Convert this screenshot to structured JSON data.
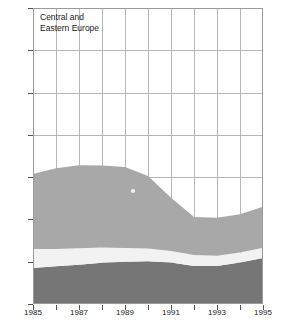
{
  "chart_data": {
    "type": "area",
    "title": "Central and\nEastern Europe",
    "xlabel": "",
    "ylabel": "",
    "ylim": [
      0,
      1400
    ],
    "xlim": [
      1985,
      1995
    ],
    "grid": true,
    "legend": "none",
    "stacked": true,
    "x": [
      1985,
      1986,
      1987,
      1988,
      1989,
      1990,
      1991,
      1992,
      1993,
      1994,
      1995
    ],
    "y_ticks": [
      0,
      200,
      400,
      600,
      800,
      1000,
      1200,
      1400
    ],
    "y_tick_labels": [
      "0",
      "200",
      "400",
      "600",
      "800",
      "1 000",
      "1 200",
      "1 400"
    ],
    "x_ticks": [
      1985,
      1986,
      1987,
      1988,
      1989,
      1990,
      1991,
      1992,
      1993,
      1994,
      1995
    ],
    "x_tick_labels": [
      "1985",
      "",
      "1987",
      "",
      "1989",
      "",
      "1991",
      "",
      "1993",
      "",
      "1995"
    ],
    "series": [
      {
        "name": "bottom-band",
        "color": "#767676",
        "values": [
          170,
          178,
          186,
          195,
          200,
          202,
          196,
          180,
          180,
          196,
          218
        ]
      },
      {
        "name": "middle-band",
        "color": "#f2f2f2",
        "values": [
          90,
          82,
          78,
          72,
          65,
          60,
          55,
          52,
          48,
          48,
          48
        ]
      },
      {
        "name": "top-band",
        "color": "#a8a8a8",
        "values": [
          355,
          382,
          392,
          388,
          383,
          343,
          252,
          180,
          180,
          181,
          194
        ]
      }
    ],
    "cumulative_totals": [
      615,
      642,
      656,
      655,
      648,
      605,
      503,
      412,
      408,
      425,
      460
    ]
  },
  "axes": {
    "y_axis_name": "y-axis",
    "x_axis_name": "x-axis"
  }
}
